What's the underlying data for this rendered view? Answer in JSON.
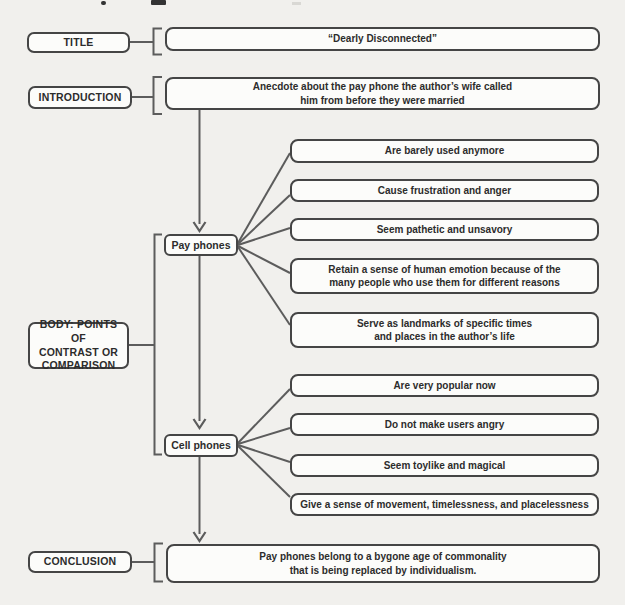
{
  "palette": {
    "page_bg": "#f1f0ed",
    "box_bg": "#fcfcfa",
    "border": "#454545",
    "line": "#5c5c5c",
    "text": "#2c2c2c"
  },
  "diagram": {
    "rows": {
      "title": {
        "label": "TITLE",
        "content": "“Dearly Disconnected”"
      },
      "introduction": {
        "label": "INTRODUCTION",
        "content": "Anecdote about the pay phone the author’s wife called\nhim from before they were married"
      },
      "body": {
        "label": "BODY: POINTS OF\nCONTRAST OR\nCOMPARISON",
        "pay_phones": {
          "node_label": "Pay phones",
          "points": [
            "Are barely used anymore",
            "Cause frustration and anger",
            "Seem pathetic and unsavory",
            "Retain a sense of human emotion because of the\nmany people who use them for different reasons",
            "Serve as landmarks of specific times\nand places in the author’s life"
          ]
        },
        "cell_phones": {
          "node_label": "Cell phones",
          "points": [
            "Are very popular now",
            "Do not make users angry",
            "Seem toylike and magical",
            "Give a sense of movement, timelessness, and placelessness"
          ]
        }
      },
      "conclusion": {
        "label": "CONCLUSION",
        "content": "Pay phones belong to a bygone age of commonality\nthat is being replaced by individualism."
      }
    }
  }
}
